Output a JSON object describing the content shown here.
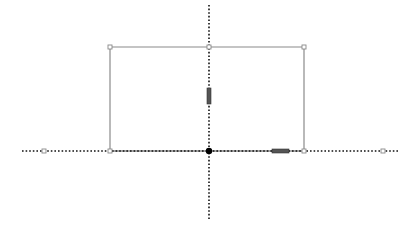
{
  "canvas": {
    "width": 417,
    "height": 240,
    "background": "#ffffff"
  },
  "axes": {
    "color": "#111111",
    "horizontal": {
      "x1": 22,
      "x2": 398,
      "y": 151
    },
    "vertical": {
      "x": 209,
      "y1": 5,
      "y2": 220
    },
    "origin": {
      "x": 209,
      "y": 151,
      "color": "#000000"
    }
  },
  "rectangle": {
    "stroke": "#8a8a8a",
    "left": 110,
    "right": 304,
    "top": 47,
    "bottom": 151
  },
  "handles": [
    {
      "name": "corner-top-left",
      "x": 110,
      "y": 47
    },
    {
      "name": "midpoint-top",
      "x": 209,
      "y": 47
    },
    {
      "name": "corner-top-right",
      "x": 304,
      "y": 47
    },
    {
      "name": "corner-bottom-left",
      "x": 110,
      "y": 151
    },
    {
      "name": "corner-bottom-right",
      "x": 304,
      "y": 151
    },
    {
      "name": "axis-end-left",
      "x": 44,
      "y": 151
    },
    {
      "name": "axis-end-right",
      "x": 383,
      "y": 151
    }
  ],
  "constraint_markers": [
    {
      "name": "vertical-marker",
      "x": 207,
      "y": 88,
      "w": 4,
      "h": 16
    },
    {
      "name": "horizontal-marker",
      "x": 272,
      "y": 149,
      "w": 17,
      "h": 4
    }
  ]
}
